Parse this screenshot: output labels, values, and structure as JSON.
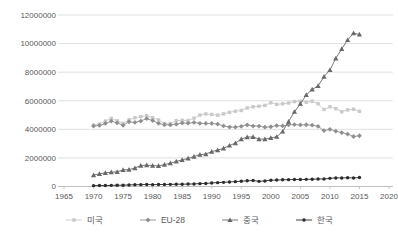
{
  "chart": {
    "background": "#ffffff",
    "grid_color": "#d9d9d9",
    "axis_color": "#bfbfbf",
    "tick_label_color": "#595959"
  },
  "chart_data": {
    "type": "line",
    "title": "",
    "xlabel": "",
    "ylabel": "",
    "grid": "horizontal",
    "legend_position": "bottom",
    "xlim": [
      1965,
      2020
    ],
    "ylim": [
      0,
      12000000
    ],
    "x_ticks": [
      1965,
      1970,
      1975,
      1980,
      1985,
      1990,
      1995,
      2000,
      2005,
      2010,
      2015,
      2020
    ],
    "y_ticks": [
      0,
      2000000,
      4000000,
      6000000,
      8000000,
      10000000,
      12000000
    ],
    "x": [
      1970,
      1971,
      1972,
      1973,
      1974,
      1975,
      1976,
      1977,
      1978,
      1979,
      1980,
      1981,
      1982,
      1983,
      1984,
      1985,
      1986,
      1987,
      1988,
      1989,
      1990,
      1991,
      1992,
      1993,
      1994,
      1995,
      1996,
      1997,
      1998,
      1999,
      2000,
      2001,
      2002,
      2003,
      2004,
      2005,
      2006,
      2007,
      2008,
      2009,
      2010,
      2011,
      2012,
      2013,
      2014,
      2015
    ],
    "series": [
      {
        "name": "미국",
        "key": "usa",
        "marker": "square",
        "color": "#c9c9c9",
        "values": [
          4300000,
          4370000,
          4580000,
          4770000,
          4600000,
          4420000,
          4670000,
          4810000,
          4890000,
          4950000,
          4810000,
          4660000,
          4410000,
          4390000,
          4610000,
          4630000,
          4620000,
          4780000,
          5000000,
          5080000,
          5040000,
          4990000,
          5080000,
          5190000,
          5270000,
          5320000,
          5500000,
          5580000,
          5620000,
          5680000,
          5860000,
          5750000,
          5790000,
          5840000,
          5940000,
          5970000,
          5890000,
          5970000,
          5790000,
          5390000,
          5580000,
          5450000,
          5230000,
          5360000,
          5410000,
          5260000
        ]
      },
      {
        "name": "EU-28",
        "key": "eu-28",
        "marker": "diamond",
        "color": "#8f8f8f",
        "values": [
          4230000,
          4270000,
          4410000,
          4570000,
          4450000,
          4280000,
          4530000,
          4480000,
          4580000,
          4750000,
          4610000,
          4420000,
          4320000,
          4310000,
          4360000,
          4440000,
          4430000,
          4480000,
          4420000,
          4410000,
          4410000,
          4370000,
          4240000,
          4160000,
          4150000,
          4210000,
          4310000,
          4230000,
          4230000,
          4150000,
          4180000,
          4260000,
          4240000,
          4320000,
          4330000,
          4310000,
          4320000,
          4290000,
          4210000,
          3910000,
          4000000,
          3870000,
          3770000,
          3670000,
          3500000,
          3550000
        ]
      },
      {
        "name": "중국",
        "key": "china",
        "marker": "triangle",
        "color": "#696969",
        "values": [
          800000,
          890000,
          960000,
          1000000,
          1030000,
          1160000,
          1180000,
          1290000,
          1460000,
          1500000,
          1460000,
          1440000,
          1530000,
          1630000,
          1760000,
          1860000,
          1970000,
          2090000,
          2230000,
          2270000,
          2440000,
          2550000,
          2670000,
          2870000,
          3040000,
          3320000,
          3460000,
          3470000,
          3320000,
          3320000,
          3400000,
          3480000,
          3850000,
          4540000,
          5230000,
          5790000,
          6410000,
          6790000,
          7040000,
          7690000,
          8150000,
          8960000,
          9630000,
          10250000,
          10730000,
          10640000
        ]
      },
      {
        "name": "한국",
        "key": "korea",
        "marker": "circle",
        "color": "#2b2b2b",
        "values": [
          60000,
          70000,
          70000,
          80000,
          90000,
          90000,
          110000,
          120000,
          130000,
          140000,
          130000,
          140000,
          140000,
          150000,
          160000,
          160000,
          170000,
          180000,
          200000,
          210000,
          250000,
          270000,
          290000,
          320000,
          340000,
          370000,
          400000,
          420000,
          360000,
          390000,
          440000,
          450000,
          470000,
          480000,
          490000,
          490000,
          500000,
          510000,
          520000,
          530000,
          570000,
          600000,
          600000,
          610000,
          600000,
          630000
        ]
      }
    ]
  }
}
